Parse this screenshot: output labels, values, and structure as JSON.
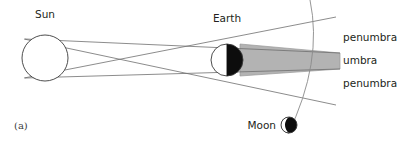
{
  "figure": {
    "panel_label": "(a)",
    "type": "lunar-eclipse-shadow-geometry",
    "width": 405,
    "height": 145,
    "background_color": "#ffffff"
  },
  "colors": {
    "umbra_fill": "#b3b3b3",
    "umbra_stroke": "#9a9a9a",
    "ray_line": "#6e6e6e",
    "orbit_arc": "#8a8a8a",
    "body_outline": "#3a3a3a",
    "body_dark_fill": "#0d0d0d",
    "body_light_fill": "#ffffff",
    "text": "#231f20"
  },
  "bodies": {
    "sun": {
      "label": "Sun",
      "cx": 45,
      "cy": 58,
      "r": 23,
      "label_x": 45,
      "label_y": 18,
      "fill": "none"
    },
    "earth": {
      "label": "Earth",
      "cx": 227,
      "cy": 60,
      "r": 16,
      "label_x": 227,
      "label_y": 22,
      "lit_side": "left",
      "shadow_side": "right"
    },
    "moon": {
      "label": "Moon",
      "cx": 289,
      "cy": 125,
      "r": 8,
      "label_x": 270,
      "label_y": 129,
      "lit_side": "upper-left",
      "shadow_side": "lower-right"
    }
  },
  "shadow_zones": [
    {
      "name": "penumbra-upper",
      "label": "penumbra",
      "label_x": 343,
      "label_y": 41
    },
    {
      "name": "umbra",
      "label": "umbra",
      "label_x": 343,
      "label_y": 64
    },
    {
      "name": "penumbra-lower",
      "label": "penumbra",
      "label_x": 343,
      "label_y": 87
    }
  ],
  "geometry": {
    "umbra_wedge_points": "240,44 340,53 340,69 240,76",
    "rays": [
      {
        "name": "umbra-edge-top",
        "x1": 25,
        "y1": 39,
        "x2": 340,
        "y2": 53
      },
      {
        "name": "umbra-edge-bottom",
        "x1": 25,
        "y1": 78,
        "x2": 340,
        "y2": 69
      },
      {
        "name": "penumbra-edge-upper",
        "x1": 24,
        "y1": 78,
        "x2": 336,
        "y2": 17
      },
      {
        "name": "penumbra-edge-lower",
        "x1": 24,
        "y1": 39,
        "x2": 336,
        "y2": 105
      }
    ],
    "orbit_arc_path": "M 310,0 Q 323,62 288,134"
  }
}
